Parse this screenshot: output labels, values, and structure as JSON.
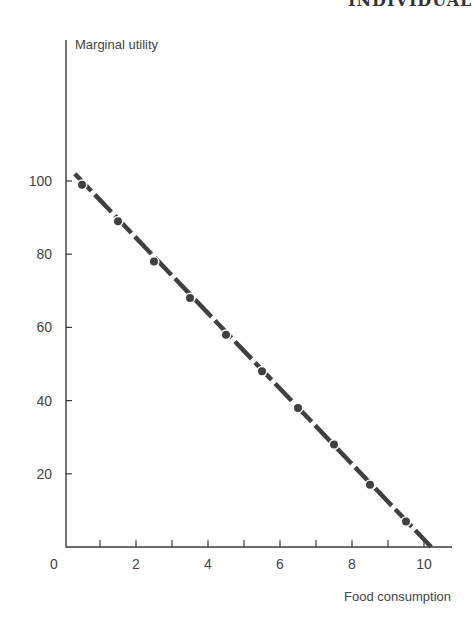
{
  "header": {
    "title": "INDIVIDUAL"
  },
  "chart_data": {
    "type": "line",
    "title": "",
    "xlabel": "Food consumption",
    "ylabel": "Marginal utility",
    "xlim": [
      0,
      11
    ],
    "ylim": [
      0,
      100
    ],
    "x_ticks": [
      0,
      1,
      2,
      3,
      4,
      5,
      6,
      7,
      8,
      9,
      10
    ],
    "x_tick_labels": [
      "0",
      "",
      "2",
      "",
      "4",
      "",
      "6",
      "",
      "8",
      "",
      "10"
    ],
    "y_ticks": [
      20,
      40,
      60,
      80,
      100
    ],
    "y_tick_labels": [
      "20",
      "40",
      "60",
      "80",
      "100"
    ],
    "grid": false,
    "legend": null,
    "series": [
      {
        "name": "Marginal utility",
        "style": "dashed line with dot markers",
        "line": {
          "x": [
            0.3,
            10.2
          ],
          "y": [
            102,
            0
          ]
        },
        "points": {
          "x": [
            0.5,
            1.5,
            2.5,
            3.5,
            4.5,
            5.5,
            6.5,
            7.5,
            8.5,
            9.5
          ],
          "y": [
            99,
            89,
            78,
            68,
            58,
            48,
            38,
            28,
            17,
            7
          ]
        }
      }
    ],
    "colors": {
      "axis": "#3a3a3a",
      "series": "#404040"
    }
  }
}
